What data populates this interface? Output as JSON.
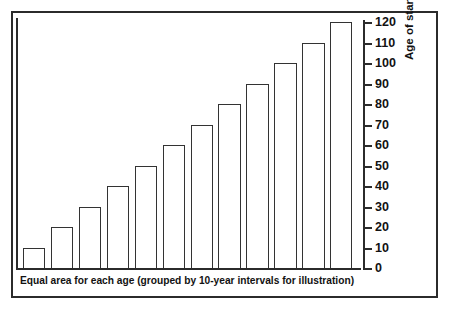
{
  "chart_data": {
    "type": "bar",
    "title": "",
    "xlabel": "Equal area for each age (grouped by 10-year intervals for illustration)",
    "ylabel": "Age of stand (years)",
    "categories": [
      "1",
      "2",
      "3",
      "4",
      "5",
      "6",
      "7",
      "8",
      "9",
      "10",
      "11",
      "12"
    ],
    "values": [
      10,
      20,
      30,
      40,
      50,
      60,
      70,
      80,
      90,
      100,
      110,
      120
    ],
    "ylim": [
      0,
      120
    ],
    "ytick_labels": [
      "0",
      "10",
      "20",
      "30",
      "40",
      "50",
      "60",
      "70",
      "80",
      "90",
      "100",
      "110",
      "120"
    ],
    "ytick_values": [
      0,
      10,
      20,
      30,
      40,
      50,
      60,
      70,
      80,
      90,
      100,
      110,
      120
    ],
    "xtick_labels": [],
    "grid": false,
    "legend": null,
    "y_axis_position": "right",
    "bar_fill_color": "#ffffff",
    "bar_edge_color": "#333333",
    "frame_color": "#2b2b2b",
    "background_color": "#ffffff"
  },
  "axis": {
    "y_title": "Age of stand (years)"
  },
  "caption": {
    "text": "Equal area for each age (grouped by 10-year intervals for illustration)"
  }
}
